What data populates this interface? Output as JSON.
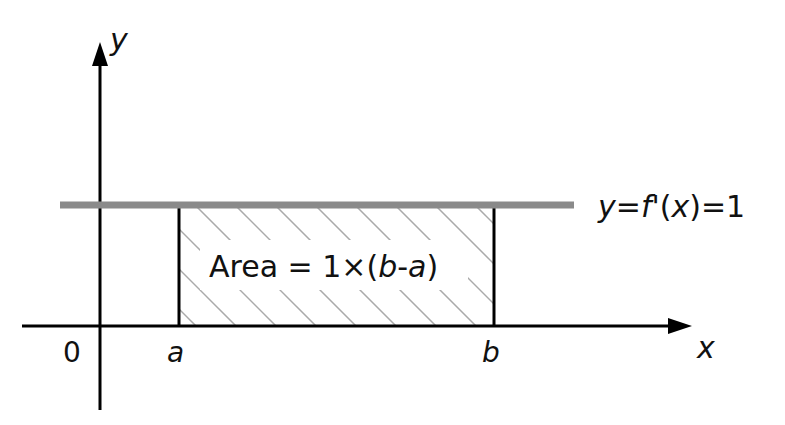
{
  "diagram": {
    "axes": {
      "x_label": "x",
      "y_label": "y",
      "origin_label": "0"
    },
    "points": {
      "a": "a",
      "b": "b"
    },
    "line": {
      "label_y": "y",
      "label_eq1": "=",
      "label_f": "f",
      "label_prime": "'(",
      "label_x": "x",
      "label_rest": ")=1",
      "color": "#8a8a8a"
    },
    "area": {
      "text_prefix": "Area = 1×(",
      "text_b": "b",
      "text_dash": "-",
      "text_a": "a",
      "text_suffix": ")",
      "hatch_color": "#aaaaaa"
    }
  }
}
